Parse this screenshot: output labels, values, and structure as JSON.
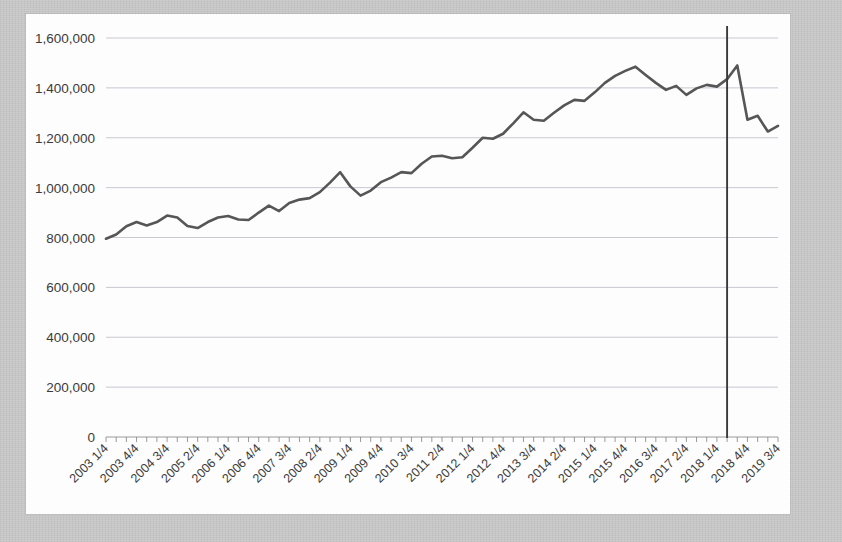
{
  "chart_data": {
    "type": "line",
    "title": "",
    "subtitle": "",
    "xlabel": "",
    "ylabel": "",
    "ylim": [
      0,
      1600000
    ],
    "ytick_labels": [
      "0",
      "200,000",
      "400,000",
      "600,000",
      "800,000",
      "1,000,000",
      "1,200,000",
      "1,400,000",
      "1,600,000"
    ],
    "ytick_values": [
      0,
      200000,
      400000,
      600000,
      800000,
      1000000,
      1200000,
      1400000,
      1600000
    ],
    "grid": true,
    "legend": "none",
    "xtick_labels_shown": [
      "2003 1/4",
      "2003 4/4",
      "2004 3/4",
      "2005 2/4",
      "2006 1/4",
      "2006 4/4",
      "2007 3/4",
      "2008 2/4",
      "2009 1/4",
      "2009 4/4",
      "2010 3/4",
      "2011 2/4",
      "2012 1/4",
      "2012 4/4",
      "2013 3/4",
      "2014 2/4",
      "2015 1/4",
      "2015 4/4",
      "2016 3/4",
      "2017 2/4",
      "2018 1/4",
      "2018 4/4",
      "2019 3/4"
    ],
    "xtick_label_interval": 3,
    "categories": [
      "2003 1/4",
      "2003 2/4",
      "2003 3/4",
      "2003 4/4",
      "2004 1/4",
      "2004 2/4",
      "2004 3/4",
      "2004 4/4",
      "2005 1/4",
      "2005 2/4",
      "2005 3/4",
      "2005 4/4",
      "2006 1/4",
      "2006 2/4",
      "2006 3/4",
      "2006 4/4",
      "2007 1/4",
      "2007 2/4",
      "2007 3/4",
      "2007 4/4",
      "2008 1/4",
      "2008 2/4",
      "2008 3/4",
      "2008 4/4",
      "2009 1/4",
      "2009 2/4",
      "2009 3/4",
      "2009 4/4",
      "2010 1/4",
      "2010 2/4",
      "2010 3/4",
      "2010 4/4",
      "2011 1/4",
      "2011 2/4",
      "2011 3/4",
      "2011 4/4",
      "2012 1/4",
      "2012 2/4",
      "2012 3/4",
      "2012 4/4",
      "2013 1/4",
      "2013 2/4",
      "2013 3/4",
      "2013 4/4",
      "2014 1/4",
      "2014 2/4",
      "2014 3/4",
      "2014 4/4",
      "2015 1/4",
      "2015 2/4",
      "2015 3/4",
      "2015 4/4",
      "2016 1/4",
      "2016 2/4",
      "2016 3/4",
      "2016 4/4",
      "2017 1/4",
      "2017 2/4",
      "2017 3/4",
      "2017 4/4",
      "2018 1/4",
      "2018 2/4",
      "2018 3/4",
      "2018 4/4",
      "2019 1/4",
      "2019 2/4",
      "2019 3/4"
    ],
    "series": [
      {
        "name": "series-1",
        "color": "#565656",
        "values": [
          795000,
          812000,
          845000,
          862000,
          848000,
          862000,
          888000,
          880000,
          846000,
          838000,
          862000,
          880000,
          886000,
          872000,
          870000,
          900000,
          928000,
          906000,
          938000,
          952000,
          958000,
          982000,
          1020000,
          1062000,
          1005000,
          968000,
          988000,
          1022000,
          1040000,
          1062000,
          1058000,
          1096000,
          1125000,
          1128000,
          1118000,
          1122000,
          1160000,
          1200000,
          1196000,
          1216000,
          1258000,
          1302000,
          1272000,
          1268000,
          1300000,
          1330000,
          1352000,
          1348000,
          1382000,
          1420000,
          1448000,
          1468000,
          1485000,
          1452000,
          1420000,
          1392000,
          1408000,
          1372000,
          1398000,
          1412000,
          1405000,
          1435000,
          1490000,
          1272000,
          1288000,
          1225000,
          1248000
        ]
      }
    ],
    "annotations": [
      {
        "type": "vertical-line",
        "name": "reference-marker",
        "at_category": "2018 2/4",
        "color": "#3a3a3a"
      }
    ]
  }
}
